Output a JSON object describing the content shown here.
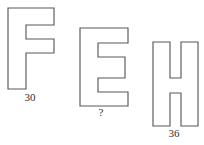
{
  "page": {
    "background_color": "#ffffff",
    "stroke_color": "#57585a",
    "text_color": "#2e2e30",
    "width": 204,
    "height": 145
  },
  "figures": [
    {
      "id": "letter-f",
      "letter": "F",
      "icon_name": "block-letter-f-shape",
      "caption": "30",
      "caption_is_unknown": false,
      "outline_points": "0,0 46,0 46,17 18,17 18,31 46,31 46,45 18,45 18,81 0,81"
    },
    {
      "id": "letter-e",
      "letter": "E",
      "icon_name": "block-letter-e-shape",
      "caption": "?",
      "caption_is_unknown": true,
      "outline_points": "0,0 48,0 48,15 18,15 18,29 45,29 45,50 18,50 18,64 48,64 48,78 0,78"
    },
    {
      "id": "letter-h",
      "letter": "H",
      "icon_name": "block-letter-h-shape",
      "caption": "36",
      "caption_is_unknown": false,
      "outline_points": "0,0 17,0 17,36 28,36 28,0 45,0 45,84 28,84 28,51 17,51 17,84 0,84"
    }
  ],
  "chart_data": {
    "type": "table",
    "title": "",
    "categories": [
      "F",
      "E",
      "H"
    ],
    "values": [
      30,
      null,
      36
    ],
    "labels": [
      "30",
      "?",
      "36"
    ],
    "xlabel": "",
    "ylabel": ""
  }
}
